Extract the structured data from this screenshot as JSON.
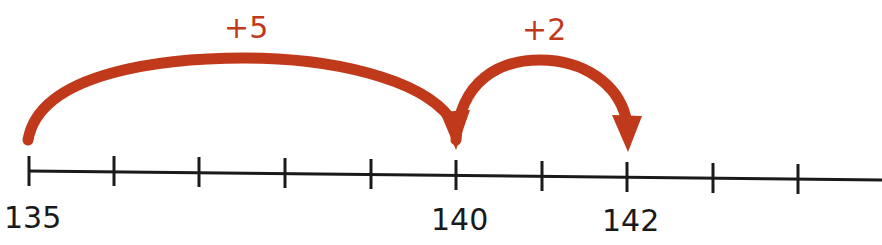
{
  "diagram": {
    "type": "number-line-jumps",
    "colors": {
      "line": "#1a1a1a",
      "arrow": "#c0391b"
    },
    "ticks": [
      135,
      136,
      137,
      138,
      139,
      140,
      141,
      142,
      143,
      144
    ],
    "labels": [
      {
        "value": 135,
        "text": "135"
      },
      {
        "value": 140,
        "text": "140"
      },
      {
        "value": 142,
        "text": "142"
      }
    ],
    "jumps": [
      {
        "from": 135,
        "to": 140,
        "label": "+5"
      },
      {
        "from": 140,
        "to": 142,
        "label": "+2"
      }
    ]
  }
}
